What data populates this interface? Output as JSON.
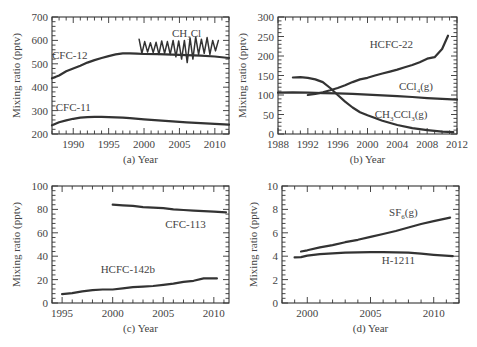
{
  "chart_data": [
    {
      "id": "a",
      "type": "line",
      "title": "",
      "xlabel": "(a) Year",
      "ylabel": "Mixing ratio (pptv)",
      "xlim": [
        1987,
        2012
      ],
      "ylim": [
        200,
        700
      ],
      "xticks": [
        1990,
        1995,
        2000,
        2005,
        2010
      ],
      "yticks": [
        200,
        300,
        400,
        500,
        600,
        700
      ],
      "grid": false,
      "legend": "inline labels",
      "frame": {
        "left": 52,
        "right": 229,
        "top": 17,
        "bottom": 134
      },
      "series": [
        {
          "name": "CFC-12",
          "label_pos": [
            1989.5,
            520
          ],
          "x": [
            1987,
            1988,
            1989,
            1990,
            1991,
            1992,
            1993,
            1994,
            1995,
            1996,
            1997,
            1998,
            1999,
            2000,
            2002,
            2004,
            2006,
            2008,
            2010,
            2012
          ],
          "values": [
            438,
            450,
            468,
            480,
            492,
            505,
            516,
            525,
            533,
            540,
            545,
            545,
            543,
            542,
            541,
            539,
            537,
            535,
            531,
            525
          ]
        },
        {
          "name": "CFC-11",
          "label_pos": [
            1990,
            300
          ],
          "x": [
            1987,
            1988,
            1989,
            1990,
            1991,
            1992,
            1993,
            1994,
            1995,
            1996,
            1997,
            1998,
            2000,
            2002,
            2004,
            2006,
            2008,
            2010,
            2012
          ],
          "values": [
            237,
            250,
            258,
            265,
            270,
            272,
            273,
            273,
            272,
            271,
            270,
            268,
            263,
            258,
            254,
            250,
            246,
            243,
            240
          ]
        },
        {
          "name": "CH3Cl",
          "label": "CH",
          "label_sub": "3",
          "label_tail": "Cl",
          "label_pos": [
            2006,
            615
          ],
          "x": [
            1999.3,
            1999.7,
            2000.1,
            2000.5,
            2000.9,
            2001.3,
            2001.7,
            2002.1,
            2002.5,
            2002.9,
            2003.3,
            2003.7,
            2004.1,
            2004.5,
            2004.9,
            2005.3,
            2005.7,
            2006.1,
            2006.5,
            2006.9,
            2007.3,
            2007.7,
            2008.1,
            2008.5,
            2008.9,
            2009.3,
            2009.7,
            2010.1,
            2010.5
          ],
          "values": [
            605,
            545,
            595,
            550,
            590,
            548,
            592,
            540,
            598,
            545,
            595,
            540,
            600,
            530,
            598,
            520,
            600,
            505,
            610,
            520,
            615,
            540,
            605,
            545,
            612,
            540,
            600,
            555,
            600
          ]
        }
      ]
    },
    {
      "id": "b",
      "type": "line",
      "title": "",
      "xlabel": "(b) Year",
      "ylabel": "Mixing ratio (pptv)",
      "xlim": [
        1988,
        2012
      ],
      "ylim": [
        0,
        300
      ],
      "xticks": [
        1988,
        1992,
        1996,
        2000,
        2004,
        2008,
        2012
      ],
      "yticks": [
        0,
        50,
        100,
        150,
        200,
        250,
        300
      ],
      "grid": false,
      "legend": "inline labels",
      "frame": {
        "left": 278,
        "right": 457,
        "top": 17,
        "bottom": 134
      },
      "series": [
        {
          "name": "HCFC-22",
          "label_pos": [
            2003.2,
            220
          ],
          "x": [
            1992,
            1993,
            1994,
            1995,
            1996,
            1997,
            1998,
            1999,
            2000,
            2001,
            2002,
            2003,
            2004,
            2005,
            2006,
            2007,
            2008,
            2009,
            2010,
            2010.8
          ],
          "values": [
            100,
            103,
            107,
            112,
            118,
            125,
            133,
            140,
            144,
            150,
            155,
            160,
            165,
            171,
            177,
            184,
            193,
            197,
            218,
            252
          ]
        },
        {
          "name": "CCl4(g)",
          "label": "CCl",
          "label_sub": "4",
          "label_tail": "(g)",
          "label_pos": [
            2006.5,
            112
          ],
          "x": [
            1988,
            1990,
            1992,
            1994,
            1996,
            1998,
            2000,
            2002,
            2004,
            2006,
            2008,
            2010,
            2012
          ],
          "values": [
            106,
            107,
            106,
            105,
            104,
            103,
            101,
            99,
            97,
            95,
            92,
            90,
            88
          ]
        },
        {
          "name": "CH3CCl3(g)",
          "label": "CH",
          "label_sub": "3",
          "label_mid": "CCl",
          "label_sub2": "3",
          "label_tail": "(g)",
          "label_pos": [
            2004.5,
            42
          ],
          "x": [
            1990,
            1991,
            1992,
            1993,
            1994,
            1995,
            1996,
            1997,
            1998,
            1999,
            2000,
            2001,
            2002,
            2004,
            2006,
            2008,
            2010,
            2011.5
          ],
          "values": [
            145,
            146,
            144,
            140,
            133,
            118,
            100,
            83,
            68,
            56,
            48,
            41,
            34,
            23,
            15,
            10,
            6,
            5
          ]
        }
      ]
    },
    {
      "id": "c",
      "type": "line",
      "title": "",
      "xlabel": "(c) Year",
      "ylabel": "Mixing ratio (pptv)",
      "xlim": [
        1994,
        2011.5
      ],
      "ylim": [
        0,
        100
      ],
      "xticks": [
        1995,
        2000,
        2005,
        2010
      ],
      "yticks": [
        0,
        20,
        40,
        60,
        80,
        100
      ],
      "grid": false,
      "legend": "inline labels",
      "frame": {
        "left": 52,
        "right": 229,
        "top": 186,
        "bottom": 303
      },
      "series": [
        {
          "name": "CFC-113",
          "label_pos": [
            2007.2,
            64
          ],
          "x": [
            2000,
            2001,
            2002,
            2003,
            2004,
            2005,
            2006,
            2007,
            2008,
            2009,
            2010,
            2011.2
          ],
          "values": [
            84,
            83.5,
            83,
            82,
            81.5,
            81,
            80,
            79.5,
            79,
            78.5,
            78,
            77.5
          ]
        },
        {
          "name": "HCFC-142b",
          "label_pos": [
            2001.5,
            26
          ],
          "x": [
            1995,
            1996,
            1997,
            1998,
            1999,
            2000,
            2001,
            2002,
            2003,
            2004,
            2005,
            2006,
            2007,
            2008,
            2009,
            2010.3
          ],
          "values": [
            7.5,
            8.5,
            10,
            11,
            11.5,
            11.5,
            12.5,
            13.5,
            14,
            14.5,
            15.5,
            16.5,
            18,
            19,
            21,
            21
          ]
        }
      ]
    },
    {
      "id": "d",
      "type": "line",
      "title": "",
      "xlabel": "(d) Year",
      "ylabel": "Mixing ratio (pptv)",
      "xlim": [
        1998,
        2012
      ],
      "ylim": [
        0,
        10
      ],
      "xticks": [
        2000,
        2005,
        2010
      ],
      "yticks": [
        0,
        2,
        4,
        6,
        8,
        10
      ],
      "grid": false,
      "legend": "inline labels",
      "frame": {
        "left": 282,
        "right": 459,
        "top": 186,
        "bottom": 303
      },
      "series": [
        {
          "name": "SF6(g)",
          "label": "SF",
          "label_sub": "6",
          "label_tail": "(g)",
          "label_pos": [
            2007.6,
            7.4
          ],
          "x": [
            1999.5,
            2000,
            2001,
            2002,
            2003,
            2004,
            2005,
            2006,
            2007,
            2008,
            2009,
            2010,
            2011.3
          ],
          "values": [
            4.4,
            4.5,
            4.75,
            4.95,
            5.2,
            5.4,
            5.65,
            5.9,
            6.15,
            6.45,
            6.75,
            7.0,
            7.3
          ]
        },
        {
          "name": "H-1211",
          "label_pos": [
            2007.2,
            3.35
          ],
          "x": [
            1999,
            1999.5,
            2000,
            2001,
            2002,
            2003,
            2004,
            2005,
            2006,
            2007,
            2008,
            2009,
            2010,
            2011.5
          ],
          "values": [
            3.9,
            3.92,
            4.05,
            4.18,
            4.25,
            4.3,
            4.33,
            4.35,
            4.35,
            4.33,
            4.3,
            4.22,
            4.12,
            4.0
          ]
        }
      ]
    }
  ]
}
